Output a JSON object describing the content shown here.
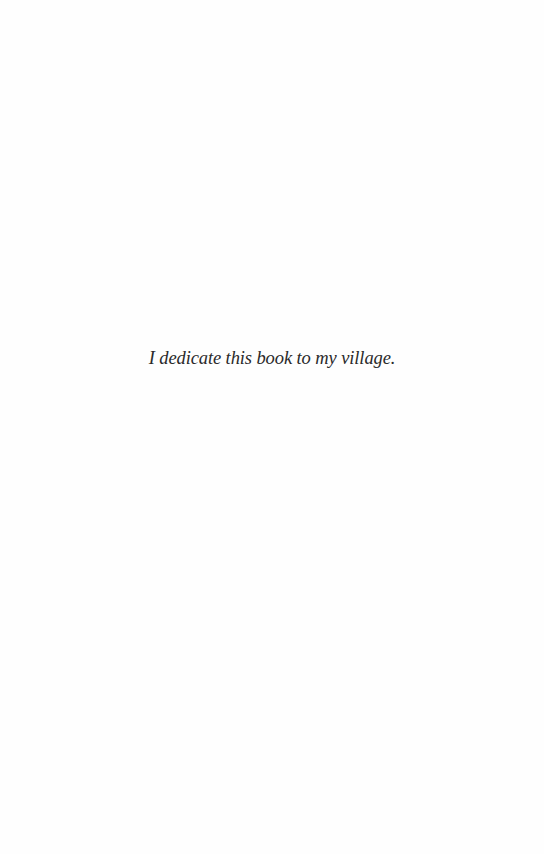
{
  "page": {
    "dedication": "I dedicate this book to my village.",
    "text_color": "#2a2a2a",
    "background_color": "#fefefe"
  }
}
